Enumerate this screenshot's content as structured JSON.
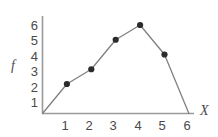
{
  "chart_data": {
    "type": "line",
    "title": "",
    "xlabel": "X",
    "ylabel": "f",
    "x": [
      0,
      1,
      2,
      3,
      4,
      5,
      6
    ],
    "values": [
      0,
      2,
      3,
      5,
      6,
      4,
      0
    ],
    "markers_at_x": [
      1,
      2,
      3,
      4,
      5
    ],
    "xlim": [
      0,
      6.4
    ],
    "ylim": [
      0,
      6.6
    ],
    "xticks": [
      "1",
      "2",
      "3",
      "4",
      "5",
      "6"
    ],
    "yticks": [
      "1",
      "2",
      "3",
      "4",
      "5",
      "6"
    ],
    "grid": false,
    "legend": null,
    "line_color": "#808080",
    "marker_color": "#2b2b2b",
    "axis_color": "#9a9a9a",
    "text_color": "#4a4a4a",
    "background": "#ffffff"
  },
  "axes": {
    "y_axis_title": "f",
    "x_axis_title": "X"
  }
}
